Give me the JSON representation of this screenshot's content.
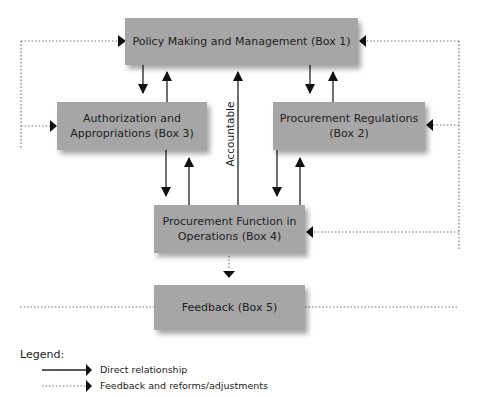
{
  "boxes": {
    "box1": "Policy Making and Management (Box 1)",
    "box2": "Procurement Regulations (Box 2)",
    "box3": "Authorization and Appropriations (Box 3)",
    "box4": "Procurement Function in Operations (Box 4)",
    "box5": "Feedback (Box 5)"
  },
  "box_lines": {
    "box2_l1": "Procurement Regulations",
    "box2_l2": "(Box 2)",
    "box3_l1": "Authorization and",
    "box3_l2": "Appropriations (Box 3)",
    "box4_l1": "Procurement Function in",
    "box4_l2": "Operations (Box 4)"
  },
  "edge_labels": {
    "accountable": "Accountable"
  },
  "legend": {
    "title": "Legend:",
    "items": [
      {
        "style": "solid",
        "label": "Direct relationship"
      },
      {
        "style": "dotted",
        "label": "Feedback and reforms/adjustments"
      }
    ]
  },
  "colors": {
    "box_fill": "#a6a6a6",
    "line": "#222222",
    "dotted_line": "#777777"
  }
}
